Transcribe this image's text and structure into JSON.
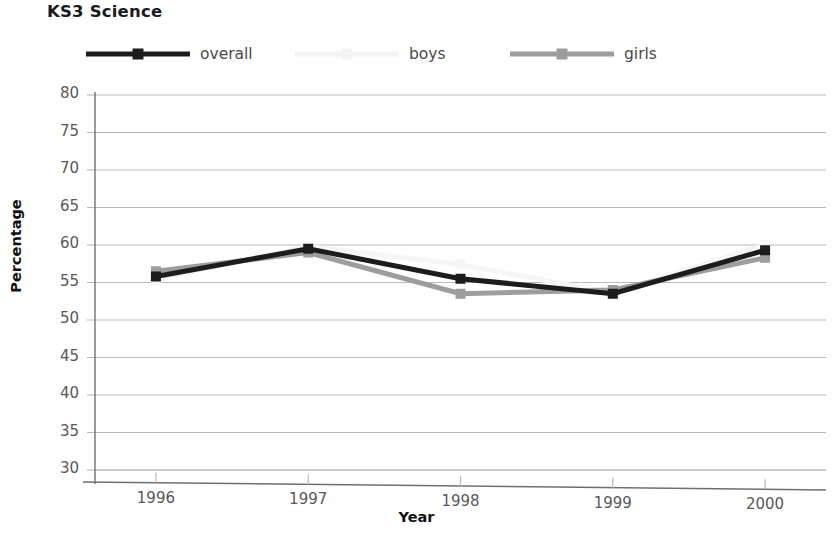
{
  "chart_data": {
    "type": "line",
    "title": "KS3 Science",
    "xlabel": "Year",
    "ylabel": "Percentage",
    "categories": [
      "1996",
      "1997",
      "1998",
      "1999",
      "2000"
    ],
    "x": [
      1996,
      1997,
      1998,
      1999,
      2000
    ],
    "xlim": [
      1995.6,
      2000.4
    ],
    "ylim": [
      30,
      80
    ],
    "yticks": [
      30,
      35,
      40,
      45,
      50,
      55,
      60,
      65,
      70,
      75,
      80
    ],
    "grid": true,
    "legend_position": "top",
    "series": [
      {
        "name": "overall",
        "values": [
          55.8,
          59.5,
          55.5,
          53.5,
          59.3
        ],
        "color": "#1c1c1c",
        "marker": "square"
      },
      {
        "name": "boys",
        "values": [
          55.4,
          59.8,
          57.4,
          53.6,
          60.0
        ],
        "color": "#f5f5f5",
        "marker": "square"
      },
      {
        "name": "girls",
        "values": [
          56.5,
          59.0,
          53.5,
          54.0,
          58.3
        ],
        "color": "#9d9d9d",
        "marker": "square"
      }
    ]
  },
  "legend": {
    "items": [
      {
        "label": "overall",
        "color": "#1c1c1c"
      },
      {
        "label": "boys",
        "color": "#f3f3f3"
      },
      {
        "label": "girls",
        "color": "#9d9d9d"
      }
    ]
  },
  "axes": {
    "y_tick_labels": [
      "80",
      "75",
      "70",
      "65",
      "60",
      "55",
      "50",
      "45",
      "40",
      "35",
      "30"
    ],
    "x_tick_labels": [
      "1996",
      "1997",
      "1998",
      "1999",
      "2000"
    ]
  },
  "colors": {
    "overall": "#1c1c1c",
    "boys": "#f3f3f3",
    "girls": "#9d9d9d",
    "grid": "#b9b9b9",
    "axis": "#6f6f6f",
    "text": "#58585a",
    "title": "#1a1a1a"
  }
}
